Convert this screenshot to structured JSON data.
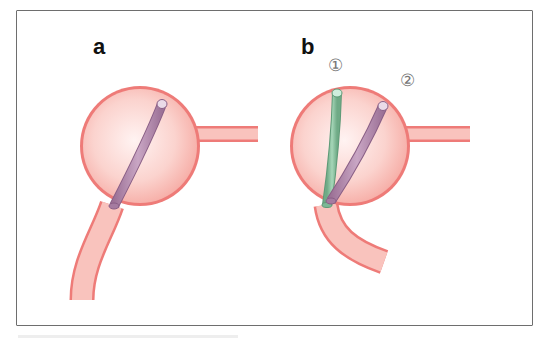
{
  "figure": {
    "panels": [
      {
        "label": "a",
        "catheters": [
          {
            "color": "#b58fb0",
            "role": "single catheter"
          }
        ]
      },
      {
        "label": "b",
        "catheters": [
          {
            "number": "①",
            "color": "#8fc5a4"
          },
          {
            "number": "②",
            "color": "#b58fb0"
          }
        ]
      }
    ],
    "colors": {
      "vessel_wall": "#ee7b78",
      "vessel_fill": "#f9c3bd",
      "sphere_center": "#fdeeee",
      "frame": "#6e6e6e"
    }
  }
}
